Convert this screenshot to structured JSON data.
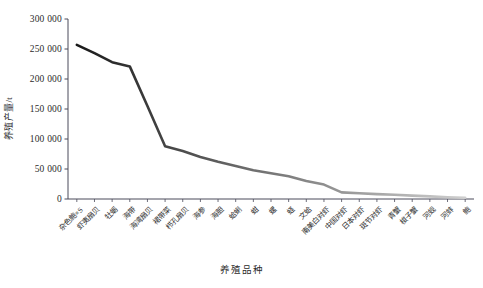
{
  "chart_data": {
    "type": "line",
    "title": "",
    "xlabel": "养殖品种",
    "ylabel": "养殖产量/t",
    "ylim": [
      0,
      300000
    ],
    "ytick_labels": [
      "0",
      "50 000",
      "100 000",
      "150 000",
      "200 000",
      "250 000",
      "300 000"
    ],
    "ytick_values": [
      0,
      50000,
      100000,
      150000,
      200000,
      250000,
      300000
    ],
    "grid": false,
    "legend": "none",
    "line_color_start": "#1a1a1a",
    "line_color_end": "#cfcfcf",
    "axis_color": "#4a4a5a",
    "categories": [
      "杂色鲍×S",
      "虾夷扇贝",
      "牡蛎",
      "海带",
      "海湾扇贝",
      "裙带菜",
      "栉孔扇贝",
      "海参",
      "海胆",
      "蛤蜊",
      "蚶",
      "螺",
      "蛏",
      "文蛤",
      "南美白对虾",
      "中国对虾",
      "日本对虾",
      "斑节对虾",
      "青蟹",
      "梭子蟹",
      "河蚬",
      "河蚌",
      "鲍"
    ],
    "values": [
      257000,
      243000,
      228000,
      221000,
      155000,
      88000,
      80000,
      70000,
      62000,
      55000,
      48000,
      43000,
      38000,
      30000,
      24000,
      11000,
      9500,
      8200,
      7000,
      5600,
      4300,
      3000,
      2000
    ]
  }
}
